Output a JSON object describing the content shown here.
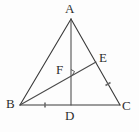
{
  "figure": {
    "background_color": "#fdfdfd",
    "line_color": "#3a3a3a",
    "label_color": "#2e2e2e",
    "tick_color": "#6a6a6a",
    "labels": {
      "A": "A",
      "B": "B",
      "C": "C",
      "D": "D",
      "E": "E",
      "F": "F"
    },
    "points": {
      "A": {
        "x": 71,
        "y": 19
      },
      "B": {
        "x": 20,
        "y": 105
      },
      "C": {
        "x": 120,
        "y": 105
      },
      "D": {
        "x": 71,
        "y": 105
      },
      "E": {
        "x": 96,
        "y": 62
      },
      "F": {
        "x": 68,
        "y": 72
      }
    },
    "segments": [
      {
        "name": "side-AB",
        "from": "A",
        "to": "B"
      },
      {
        "name": "side-AC",
        "from": "A",
        "to": "C"
      },
      {
        "name": "side-BC",
        "from": "B",
        "to": "C"
      },
      {
        "name": "cevian-AD",
        "from": "A",
        "to": "D"
      },
      {
        "name": "cevian-BE",
        "from": "B",
        "to": "E"
      }
    ],
    "marks": {
      "tick_on_BD": {
        "x": 45,
        "y": 105
      },
      "tick_on_EC": {
        "x": 108,
        "y": 84
      },
      "right_angle_at_F": {
        "x": 68,
        "y": 72
      }
    }
  }
}
